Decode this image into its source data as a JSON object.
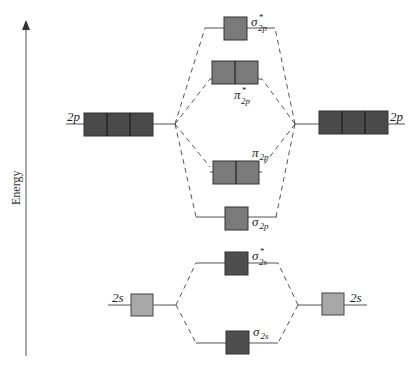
{
  "axis": {
    "label": "Energy",
    "direction": "up"
  },
  "colors": {
    "p_atomic": "#4a4a4a",
    "s_atomic": "#a8a8a8",
    "mo_2p": "#7a7a7a",
    "mo_2s": "#4e4e4e",
    "line": "#555555"
  },
  "atomic_orbitals": {
    "left_2p": {
      "label": "2p",
      "boxes": 3
    },
    "right_2p": {
      "label": "2p",
      "boxes": 3
    },
    "left_2s": {
      "label": "2s",
      "boxes": 1
    },
    "right_2s": {
      "label": "2s",
      "boxes": 1
    }
  },
  "molecular_orbitals": [
    {
      "id": "sigma_star_2p",
      "symbol": "σ",
      "star": "*",
      "sub": "2p",
      "boxes": 1
    },
    {
      "id": "pi_star_2p",
      "symbol": "π",
      "star": "*",
      "sub": "2p",
      "boxes": 2
    },
    {
      "id": "pi_2p",
      "symbol": "π",
      "star": "",
      "sub": "2p",
      "boxes": 2
    },
    {
      "id": "sigma_2p",
      "symbol": "σ",
      "star": "",
      "sub": "2p",
      "boxes": 1
    },
    {
      "id": "sigma_star_2s",
      "symbol": "σ",
      "star": "*",
      "sub": "2s",
      "boxes": 1
    },
    {
      "id": "sigma_2s",
      "symbol": "σ",
      "star": "",
      "sub": "2s",
      "boxes": 1
    }
  ]
}
